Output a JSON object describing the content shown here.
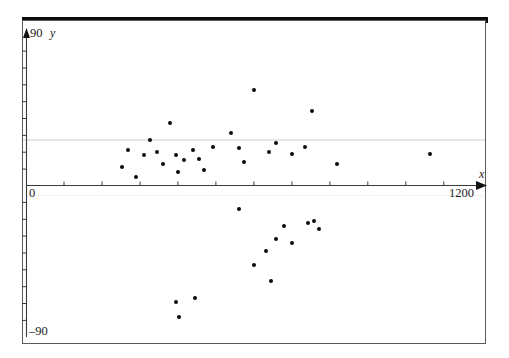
{
  "figure": {
    "background_color": "#ffffff",
    "ink_color": "#0a0a0a",
    "frame_color": "#5a5a5a"
  },
  "labels": {
    "y_top": "90",
    "y_bottom": "–90",
    "x_origin": "0",
    "x_max": "1200",
    "y_axis_name": "y",
    "x_axis_name": "x"
  },
  "chart_data": {
    "type": "scatter",
    "title": "",
    "xlabel": "x",
    "ylabel": "y",
    "xlim": [
      0,
      1200
    ],
    "ylim": [
      -90,
      90
    ],
    "grid": false,
    "legend": "none",
    "x_tick_labels": [
      "0",
      "1200"
    ],
    "y_tick_labels": [
      "90",
      "0",
      "–90"
    ],
    "x_tick_interval": 100,
    "y_tick_interval": 10,
    "marker": "filled-circle",
    "marker_size_px": 4,
    "n_points": 36,
    "points": [
      {
        "x": 252,
        "y": 11
      },
      {
        "x": 268,
        "y": 21
      },
      {
        "x": 290,
        "y": 5
      },
      {
        "x": 310,
        "y": 18
      },
      {
        "x": 325,
        "y": 27
      },
      {
        "x": 345,
        "y": 20
      },
      {
        "x": 360,
        "y": 13
      },
      {
        "x": 378,
        "y": 37
      },
      {
        "x": 395,
        "y": 18
      },
      {
        "x": 400,
        "y": 8
      },
      {
        "x": 415,
        "y": 15
      },
      {
        "x": 440,
        "y": 21
      },
      {
        "x": 455,
        "y": 16
      },
      {
        "x": 468,
        "y": 9
      },
      {
        "x": 492,
        "y": 23
      },
      {
        "x": 540,
        "y": 31
      },
      {
        "x": 560,
        "y": 22
      },
      {
        "x": 575,
        "y": 14
      },
      {
        "x": 600,
        "y": 57
      },
      {
        "x": 640,
        "y": 20
      },
      {
        "x": 660,
        "y": 25
      },
      {
        "x": 700,
        "y": 19
      },
      {
        "x": 735,
        "y": 23
      },
      {
        "x": 755,
        "y": 44
      },
      {
        "x": 820,
        "y": 13
      },
      {
        "x": 1065,
        "y": 19
      },
      {
        "x": 560,
        "y": -14
      },
      {
        "x": 600,
        "y": -47
      },
      {
        "x": 632,
        "y": -39
      },
      {
        "x": 645,
        "y": -57
      },
      {
        "x": 660,
        "y": -32
      },
      {
        "x": 680,
        "y": -24
      },
      {
        "x": 700,
        "y": -34
      },
      {
        "x": 742,
        "y": -22
      },
      {
        "x": 760,
        "y": -21
      },
      {
        "x": 772,
        "y": -26
      },
      {
        "x": 395,
        "y": -69
      },
      {
        "x": 402,
        "y": -78
      },
      {
        "x": 445,
        "y": -67
      }
    ]
  }
}
